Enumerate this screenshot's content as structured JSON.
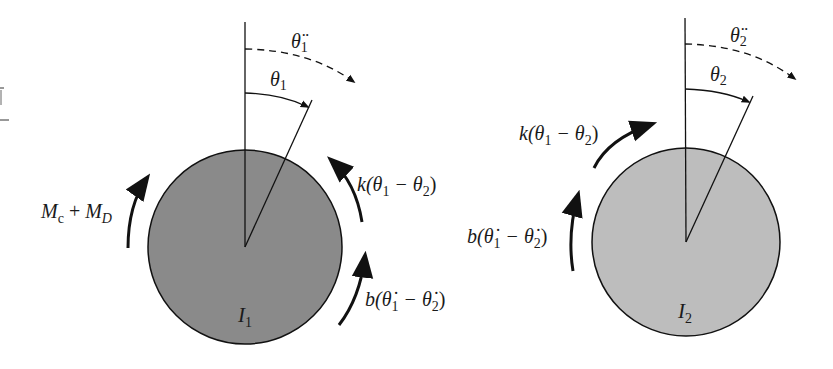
{
  "diagram": {
    "type": "free-body diagram",
    "colors": {
      "disk1_fill": "#8a8a8a",
      "disk2_fill": "#bdbdbd",
      "stroke": "#111111",
      "background": "#ffffff"
    },
    "disk1": {
      "inertia_label": {
        "base": "I",
        "sub": "1"
      },
      "angle_label": {
        "base": "θ",
        "sub": "1"
      },
      "accel_label": {
        "base": "θ̈",
        "sub": "1"
      },
      "torques": [
        {
          "id": "applied",
          "text_a": "M",
          "sub_a": "c",
          "op": " + ",
          "text_b": "M",
          "sub_b": "D"
        },
        {
          "id": "spring",
          "prefix": "k(θ",
          "sub1": "1",
          "mid": " − θ",
          "sub2": "2",
          "suffix": ")"
        },
        {
          "id": "damper",
          "prefix": "b(θ̇",
          "sub1": "1",
          "mid": " − θ̇",
          "sub2": "2",
          "suffix": ")"
        }
      ]
    },
    "disk2": {
      "inertia_label": {
        "base": "I",
        "sub": "2"
      },
      "angle_label": {
        "base": "θ",
        "sub": "2"
      },
      "accel_label": {
        "base": "θ̈",
        "sub": "2"
      },
      "torques": [
        {
          "id": "spring",
          "prefix": "k(θ",
          "sub1": "1",
          "mid": " − θ",
          "sub2": "2",
          "suffix": ")"
        },
        {
          "id": "damper",
          "prefix": "b(θ̇",
          "sub1": "1",
          "mid": " − θ̇",
          "sub2": "2",
          "suffix": ")"
        }
      ]
    }
  }
}
